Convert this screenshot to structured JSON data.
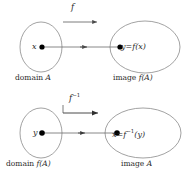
{
  "figure": {
    "stroke_color": "#6e6e6e",
    "text_color": "#2b2b2b",
    "dot_color": "#000000",
    "background_color": "#ffffff"
  },
  "forward": {
    "map_label": "f",
    "source_point": "x",
    "target_equation_lhs": "y",
    "target_equation_rel": "=",
    "target_equation_rhs_fn": "f",
    "target_equation_rhs_arg": "(x)",
    "source_caption_word": "domain",
    "source_caption_set": "A",
    "target_caption_word": "image",
    "target_caption_set": "f(A)"
  },
  "inverse": {
    "map_label_base": "f",
    "map_label_exponent": "−1",
    "source_point": "y",
    "target_equation_lhs": "x",
    "target_equation_rel": "=",
    "target_equation_rhs_fn": "f",
    "target_equation_rhs_exp": "−1",
    "target_equation_rhs_arg": "(y)",
    "source_caption_word": "domain",
    "source_caption_set": "f(A)",
    "target_caption_word": "image",
    "target_caption_set": "A"
  }
}
